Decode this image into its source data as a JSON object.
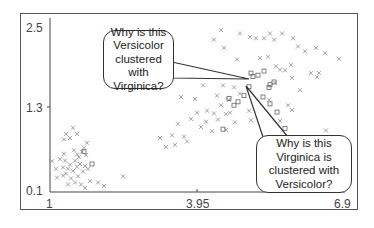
{
  "chart_data": {
    "type": "scatter",
    "title": "",
    "xlabel": "",
    "ylabel": "",
    "xlim": [
      1,
      6.9
    ],
    "ylim": [
      0.1,
      2.5
    ],
    "x_ticks": [
      "1",
      "3.95",
      "6.9"
    ],
    "y_ticks": [
      "0.1",
      "1.3",
      "2.5"
    ],
    "grid": false,
    "legend": null,
    "series": [
      {
        "name": "Cluster A (setosa-like, cross markers)",
        "marker": "x",
        "points": [
          [
            1.14,
            0.31
          ],
          [
            1.26,
            0.34
          ],
          [
            1.32,
            0.37
          ],
          [
            1.26,
            0.46
          ],
          [
            1.36,
            0.44
          ],
          [
            1.46,
            0.41
          ],
          [
            1.4,
            0.5
          ],
          [
            1.54,
            0.47
          ],
          [
            1.3,
            0.56
          ],
          [
            1.2,
            0.58
          ],
          [
            1.28,
            0.66
          ],
          [
            1.5,
            0.56
          ],
          [
            1.6,
            0.51
          ],
          [
            1.7,
            0.48
          ],
          [
            1.76,
            0.44
          ],
          [
            1.66,
            0.4
          ],
          [
            1.56,
            0.33
          ],
          [
            1.42,
            0.3
          ],
          [
            1.5,
            0.24
          ],
          [
            1.62,
            0.21
          ],
          [
            1.36,
            0.21
          ],
          [
            1.8,
            0.26
          ],
          [
            1.96,
            0.24
          ],
          [
            2.08,
            0.19
          ],
          [
            1.7,
            0.16
          ],
          [
            1.04,
            0.55
          ],
          [
            1.12,
            0.44
          ],
          [
            1.58,
            0.61
          ],
          [
            1.54,
            0.65
          ],
          [
            1.64,
            0.69
          ],
          [
            1.72,
            0.64
          ],
          [
            1.48,
            0.71
          ],
          [
            1.68,
            0.75
          ],
          [
            1.28,
            0.87
          ],
          [
            1.32,
            0.95
          ],
          [
            1.4,
            0.89
          ],
          [
            1.54,
            0.95
          ],
          [
            1.46,
            1.04
          ],
          [
            1.74,
            0.82
          ],
          [
            2.46,
            0.33
          ]
        ]
      },
      {
        "name": "Cluster B (versicolor-like, cross markers)",
        "marker": "x",
        "points": [
          [
            3.2,
            0.89
          ],
          [
            3.32,
            0.76
          ],
          [
            3.5,
            0.79
          ],
          [
            3.44,
            0.93
          ],
          [
            3.68,
            0.91
          ],
          [
            3.82,
            1.17
          ],
          [
            3.74,
            0.84
          ],
          [
            3.94,
            1.26
          ],
          [
            4.14,
            1.29
          ],
          [
            4.28,
            1.25
          ],
          [
            4.42,
            1.37
          ],
          [
            4.52,
            1.24
          ],
          [
            4.58,
            1.45
          ],
          [
            4.6,
            1.26
          ],
          [
            4.12,
            1.13
          ],
          [
            4.24,
            0.99
          ],
          [
            4.36,
            1.16
          ],
          [
            4.02,
            1.05
          ],
          [
            3.9,
            1.46
          ],
          [
            4.34,
            1.51
          ],
          [
            4.52,
            1.01
          ],
          [
            4.7,
            1.12
          ],
          [
            4.8,
            1.54
          ],
          [
            4.68,
            1.63
          ],
          [
            5.02,
            1.15
          ],
          [
            3.56,
            1.1
          ],
          [
            4.06,
            1.66
          ],
          [
            4.98,
            1.29
          ],
          [
            4.46,
            1.66
          ],
          [
            3.62,
            1.49
          ]
        ]
      },
      {
        "name": "Cluster C (virginica-like, cross markers)",
        "marker": "x",
        "points": [
          [
            4.42,
            2.47
          ],
          [
            4.8,
            2.42
          ],
          [
            5.0,
            2.37
          ],
          [
            5.28,
            2.35
          ],
          [
            5.4,
            2.42
          ],
          [
            5.48,
            2.33
          ],
          [
            5.64,
            2.42
          ],
          [
            5.86,
            2.35
          ],
          [
            6.1,
            2.16
          ],
          [
            6.32,
            2.21
          ],
          [
            6.5,
            2.13
          ],
          [
            6.78,
            2.05
          ],
          [
            5.96,
            2.23
          ],
          [
            5.82,
            1.96
          ],
          [
            5.6,
            1.89
          ],
          [
            5.52,
            1.94
          ],
          [
            5.7,
            1.88
          ],
          [
            5.36,
            2.08
          ],
          [
            5.12,
            2.35
          ],
          [
            6.22,
            1.84
          ],
          [
            6.38,
            1.84
          ],
          [
            6.34,
            1.78
          ],
          [
            5.84,
            1.77
          ],
          [
            6.0,
            1.59
          ],
          [
            5.5,
            1.7
          ],
          [
            5.76,
            1.37
          ],
          [
            5.84,
            1.3
          ],
          [
            5.6,
            1.14
          ],
          [
            6.52,
            1.0
          ],
          [
            4.48,
            2.21
          ],
          [
            4.28,
            2.33
          ],
          [
            5.2,
            2.06
          ],
          [
            4.74,
            2.04
          ],
          [
            5.38,
            1.45
          ]
        ]
      },
      {
        "name": "Cluster D (square markers, mixed region)",
        "marker": "square",
        "points": [
          [
            5.02,
            1.84
          ],
          [
            5.06,
            1.79
          ],
          [
            5.16,
            1.81
          ],
          [
            5.28,
            1.87
          ],
          [
            5.4,
            1.67
          ],
          [
            5.48,
            1.71
          ],
          [
            4.88,
            1.51
          ],
          [
            5.4,
            1.39
          ],
          [
            5.26,
            1.49
          ],
          [
            5.54,
            1.27
          ],
          [
            5.38,
            1.63
          ],
          [
            4.58,
            1.47
          ],
          [
            4.68,
            1.37
          ],
          [
            4.76,
            1.42
          ],
          [
            4.98,
            1.64
          ],
          [
            4.46,
            1.02
          ],
          [
            5.7,
            1.03
          ],
          [
            1.84,
            0.51
          ],
          [
            1.68,
            0.69
          ]
        ]
      }
    ],
    "annotations": [
      {
        "text": "Why is this\nVersicolor\nclustered with\nVirginica?",
        "points_to": [
          5.06,
          1.77
        ]
      },
      {
        "text": "Why is this\nVirginica is\nclustered with\nVersicolor?",
        "points_to": [
          4.96,
          1.67
        ]
      }
    ]
  },
  "axes": {
    "x_tick_labels": [
      "1",
      "3.95",
      "6.9"
    ],
    "y_tick_labels": [
      "2.5",
      "1.3",
      "0.1"
    ]
  },
  "callouts": {
    "versicolor_question": "Why is this\nVersicolor\nclustered with\nVirginica?",
    "virginica_question": "Why is this\nVirginica is\nclustered with\nVersicolor?"
  },
  "colors": {
    "marker": "#8a8a8a",
    "axis": "#444444",
    "frame": "#555555"
  }
}
